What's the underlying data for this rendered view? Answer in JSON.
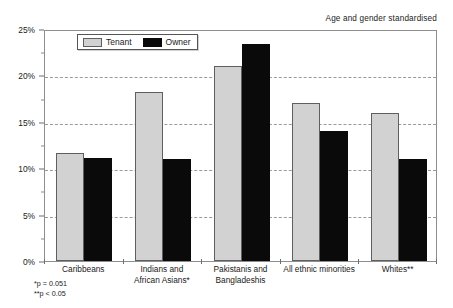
{
  "annotation": {
    "standardised_note": "Age and gender standardised"
  },
  "legend": {
    "position": "top-left-inside",
    "items": [
      {
        "label": "Tenant",
        "color": "#d2d2d2"
      },
      {
        "label": "Owner",
        "color": "#0a0a0a"
      }
    ]
  },
  "footnotes": [
    "*p = 0.051",
    "**p < 0.05"
  ],
  "chart_data": {
    "type": "bar",
    "title": "",
    "subtitle": "",
    "xlabel": "",
    "ylabel": "",
    "ylim": [
      0,
      25
    ],
    "ytick_labels": [
      "0%",
      "5%",
      "10%",
      "15%",
      "20%",
      "25%"
    ],
    "ytick_values": [
      0,
      5,
      10,
      15,
      20,
      25
    ],
    "yminor_step": 1.25,
    "grid": "horizontal-dashed",
    "legend_position": "upper-left-inside",
    "categories": [
      "Caribbeans",
      "Indians and African Asians*",
      "Pakistanis and Bangladeshis",
      "All ethnic minorities",
      "Whites**"
    ],
    "category_lines": [
      [
        "Caribbeans"
      ],
      [
        "Indians and",
        "African Asians*"
      ],
      [
        "Pakistanis and",
        "Bangladeshis"
      ],
      [
        "All ethnic minorities"
      ],
      [
        "Whites**"
      ]
    ],
    "series": [
      {
        "name": "Tenant",
        "color": "#d2d2d2",
        "values": [
          11.6,
          18.2,
          21.0,
          17.0,
          15.9
        ]
      },
      {
        "name": "Owner",
        "color": "#0a0a0a",
        "values": [
          11.1,
          11.0,
          23.4,
          14.0,
          11.0
        ]
      }
    ],
    "annotations": [
      "Age and gender standardised"
    ]
  }
}
